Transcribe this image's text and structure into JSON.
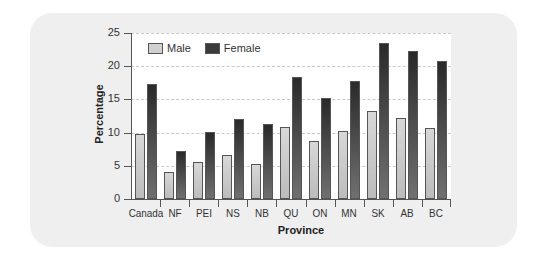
{
  "chart_data": {
    "type": "bar",
    "title": "",
    "xlabel": "Province",
    "ylabel": "Percentage",
    "ylim": [
      0,
      25
    ],
    "yticks": [
      0,
      5,
      10,
      15,
      20,
      25
    ],
    "grid": true,
    "legend_position": "top-left inside",
    "categories": [
      "Canada",
      "NF",
      "PEI",
      "NS",
      "NB",
      "QU",
      "ON",
      "MN",
      "SK",
      "AB",
      "BC"
    ],
    "series": [
      {
        "name": "Male",
        "color": "#c8c8c8",
        "values": [
          9.8,
          4.0,
          5.5,
          6.7,
          5.2,
          10.9,
          8.7,
          10.2,
          13.2,
          12.2,
          10.7
        ]
      },
      {
        "name": "Female",
        "color": "#3a3a3a",
        "values": [
          17.3,
          7.2,
          10.1,
          12.1,
          11.3,
          18.4,
          15.2,
          17.7,
          23.5,
          22.3,
          20.8
        ]
      }
    ]
  },
  "legend": {
    "male": "Male",
    "female": "Female"
  }
}
